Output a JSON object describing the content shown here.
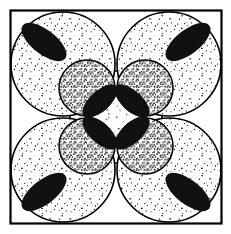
{
  "figure": {
    "canvas": {
      "width": 231,
      "height": 234,
      "background": "#ffffff"
    },
    "frame": {
      "name": "outer-square-frame",
      "x": 10.5,
      "y": 10.5,
      "width": 211,
      "height": 213,
      "stroke": "#000000",
      "stroke_width": 2.2,
      "fill": "none"
    },
    "colors": {
      "ink": "#000000",
      "paper": "#ffffff",
      "solid_black": "#111111",
      "stipple_light": "#000000",
      "stipple_dense": "#000000"
    },
    "stipple": {
      "light_label": "sparse dots",
      "light_spacing": 5.0,
      "light_dot_radius": 0.62,
      "dense_label": "dense dots",
      "dense_spacing": 2.6,
      "dense_dot_radius": 0.7,
      "center_label": "very sparse dots",
      "center_spacing": 7.2,
      "center_dot_radius": 0.62
    },
    "center_region": {
      "name": "center-rounded-square",
      "cx": 116,
      "cy": 117,
      "half": 46,
      "corner_radius": 30,
      "fill_pattern": "center-sparse"
    },
    "big_circles": [
      {
        "name": "big-circle-top-left",
        "cx": 63,
        "cy": 64,
        "r": 52,
        "fill_pattern": "light"
      },
      {
        "name": "big-circle-top-right",
        "cx": 169,
        "cy": 64,
        "r": 52,
        "fill_pattern": "light"
      },
      {
        "name": "big-circle-bottom-left",
        "cx": 63,
        "cy": 170,
        "r": 52,
        "fill_pattern": "light"
      },
      {
        "name": "big-circle-bottom-right",
        "cx": 169,
        "cy": 170,
        "r": 52,
        "fill_pattern": "light"
      }
    ],
    "small_circles": [
      {
        "name": "small-circle-top-left",
        "cx": 87,
        "cy": 88,
        "r": 28,
        "fill_pattern": "dense"
      },
      {
        "name": "small-circle-top-right",
        "cx": 145,
        "cy": 88,
        "r": 28,
        "fill_pattern": "dense"
      },
      {
        "name": "small-circle-bottom-left",
        "cx": 87,
        "cy": 146,
        "r": 28,
        "fill_pattern": "dense"
      },
      {
        "name": "small-circle-bottom-right",
        "cx": 145,
        "cy": 146,
        "r": 28,
        "fill_pattern": "dense"
      }
    ],
    "black_lenses": [
      {
        "name": "black-lens-outer-top-left",
        "cx": 44,
        "cy": 42,
        "rx": 27,
        "ry": 12,
        "rotation": 38
      },
      {
        "name": "black-lens-outer-top-right",
        "cx": 188,
        "cy": 42,
        "rx": 27,
        "ry": 12,
        "rotation": -38
      },
      {
        "name": "black-lens-outer-bottom-left",
        "cx": 44,
        "cy": 192,
        "rx": 27,
        "ry": 12,
        "rotation": -38
      },
      {
        "name": "black-lens-outer-bottom-right",
        "cx": 188,
        "cy": 192,
        "rx": 27,
        "ry": 12,
        "rotation": 38
      },
      {
        "name": "black-lens-inner-top-left",
        "cx": 100,
        "cy": 101,
        "rx": 22,
        "ry": 10,
        "rotation": -42
      },
      {
        "name": "black-lens-inner-top-right",
        "cx": 132,
        "cy": 101,
        "rx": 22,
        "ry": 10,
        "rotation": 42
      },
      {
        "name": "black-lens-inner-bottom-left",
        "cx": 100,
        "cy": 133,
        "rx": 22,
        "ry": 10,
        "rotation": 42
      },
      {
        "name": "black-lens-inner-bottom-right",
        "cx": 132,
        "cy": 133,
        "rx": 22,
        "ry": 10,
        "rotation": -42
      }
    ],
    "outlines": {
      "stroke": "#000000",
      "big_stroke_width": 1.6,
      "small_stroke_width": 1.5,
      "center_stroke_width": 1.6
    }
  }
}
